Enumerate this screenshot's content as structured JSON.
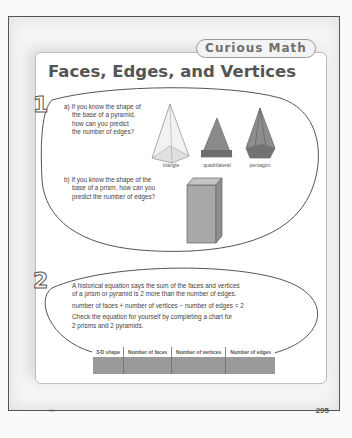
{
  "header": {
    "tab_label": "Curious Math",
    "title": "Faces, Edges, and Vertices"
  },
  "question1": {
    "number": "1",
    "part_a": "a)  If you know the shape of the base of a pyramid, how can you predict the number of edges?",
    "part_a_lines": [
      "a)  If you know the shape of",
      "the base of a pyramid,",
      "how can you predict",
      "the number of edges?"
    ],
    "pyramids": [
      {
        "label": "triangle",
        "icon": "triangular-pyramid-icon"
      },
      {
        "label": "quadrilateral",
        "icon": "square-pyramid-icon"
      },
      {
        "label": "pentagon",
        "icon": "pentagonal-pyramid-icon"
      }
    ],
    "part_b_lines": [
      "b)  If you know the shape of the",
      "base of a prism, how can you",
      "predict the number of edges?"
    ],
    "prism_icon": "rectangular-prism-icon"
  },
  "question2": {
    "number": "2",
    "lines": [
      "A historical equation says the sum of the faces and vertices",
      "of a prism or pyramid is 2 more than the number of edges.",
      "number of faces + number of vertices − number of edges = 2",
      "Check the equation for yourself by completing a chart for",
      "2 prisms and 2 pyramids."
    ],
    "table": {
      "headers": [
        "3-D shape",
        "Number of faces",
        "Number of vertices",
        "Number of edges"
      ],
      "rows": [
        [
          "",
          "",
          "",
          ""
        ]
      ]
    }
  },
  "footer": {
    "page_number": "295",
    "left_mark": "NEL"
  }
}
